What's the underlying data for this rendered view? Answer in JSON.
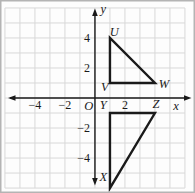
{
  "chart_data": {
    "type": "scatter",
    "title": "",
    "xlabel": "x",
    "ylabel": "y",
    "origin_label": "O",
    "xlim": [
      -6.33,
      6.67
    ],
    "ylim": [
      -6.33,
      6.53
    ],
    "grid": true,
    "grid_step": 1,
    "grid_range": [
      -6,
      6
    ],
    "x_ticks": [
      {
        "value": -4,
        "label": "−4"
      },
      {
        "value": -2,
        "label": "−2"
      },
      {
        "value": 2,
        "label": "2"
      }
    ],
    "y_ticks": [
      {
        "value": 4,
        "label": "4"
      },
      {
        "value": 2,
        "label": "2"
      },
      {
        "value": -2,
        "label": "−2"
      },
      {
        "value": -4,
        "label": "−4"
      }
    ],
    "axis_labels": [
      {
        "text": "x",
        "pos": [
          5.4,
          -0.5
        ],
        "name": "x-axis-label"
      },
      {
        "text": "y",
        "pos": [
          0.55,
          5.9
        ],
        "name": "y-axis-label"
      },
      {
        "text": "O",
        "pos": [
          -0.42,
          -0.55
        ],
        "name": "origin-label"
      }
    ],
    "triangles": [
      {
        "name": "triangle-UVW",
        "vertices": [
          {
            "label": "U",
            "x": 1,
            "y": 4,
            "label_pos": [
              1.28,
              4.4
            ]
          },
          {
            "label": "V",
            "x": 1,
            "y": 1,
            "label_pos": [
              0.65,
              0.75
            ]
          },
          {
            "label": "W",
            "x": 4,
            "y": 1,
            "label_pos": [
              4.6,
              0.9
            ]
          }
        ]
      },
      {
        "name": "triangle-XYZ",
        "vertices": [
          {
            "label": "Y",
            "x": 1,
            "y": -1,
            "label_pos": [
              0.55,
              -0.47
            ]
          },
          {
            "label": "Z",
            "x": 4,
            "y": -1,
            "label_pos": [
              4.07,
              -0.42
            ]
          },
          {
            "label": "X",
            "x": 1,
            "y": -6,
            "label_pos": [
              0.55,
              -5.28
            ]
          }
        ]
      }
    ],
    "colors": {
      "line": "#1a1a1a",
      "grid": "#d8d8d8",
      "background": "#fdfdfd",
      "border": "#b4b4b4"
    }
  }
}
